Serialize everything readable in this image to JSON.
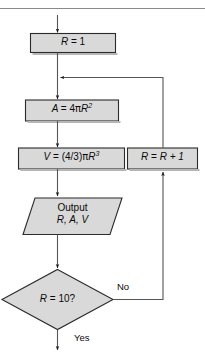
{
  "figure": {
    "kind": "flowchart",
    "caption_rule_visible": true,
    "background_color": "#ffffff",
    "node_fill_color": "#d9d9d9",
    "node_stroke_color": "#2b2b2b",
    "connector_color": "#555555",
    "text_color": "#0a0a0a"
  },
  "nodes": {
    "init": {
      "shape": "process",
      "text": "R = 1",
      "lhs": "R",
      "operator": "=",
      "rhs": "1"
    },
    "area": {
      "shape": "process",
      "text": "A = 4πR2",
      "lhs": "A",
      "operator": "=",
      "rhs_coefficient": "4",
      "rhs_pi": "π",
      "rhs_variable": "R",
      "rhs_exponent": "2"
    },
    "volume": {
      "shape": "process",
      "text": "V = (4/3)πR3",
      "lhs": "V",
      "operator": "=",
      "rhs_fraction": "(4/3)",
      "rhs_pi": "π",
      "rhs_variable": "R",
      "rhs_exponent": "3"
    },
    "output": {
      "shape": "parallelogram",
      "line1": "Output",
      "line2": "R, A, V"
    },
    "decision": {
      "shape": "diamond",
      "text": "R = 10?",
      "lhs": "R",
      "operator": "=",
      "rhs": "10?"
    },
    "increment": {
      "shape": "process",
      "text": "R = R + 1",
      "lhs": "R",
      "operator": "=",
      "rhs": "R + 1"
    }
  },
  "edges": {
    "entry": {
      "label": "",
      "from": "top",
      "to": "init"
    },
    "init_to_area": {
      "label": ""
    },
    "area_to_volume": {
      "label": ""
    },
    "volume_to_output": {
      "label": ""
    },
    "output_to_decision": {
      "label": ""
    },
    "decision_no": {
      "label": "No",
      "from": "decision",
      "to": "increment"
    },
    "decision_yes": {
      "label": "Yes",
      "from": "decision",
      "to": "exit"
    },
    "increment_to_loop": {
      "label": ""
    }
  }
}
